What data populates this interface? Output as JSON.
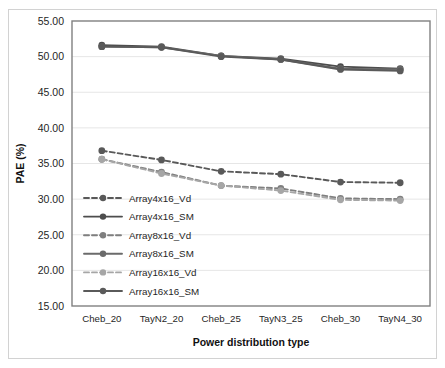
{
  "chart_data": {
    "type": "line",
    "title": "",
    "xlabel": "Power distribution type",
    "ylabel": "PAE (%)",
    "categories": [
      "Cheb_20",
      "TayN2_20",
      "Cheb_25",
      "TayN3_25",
      "Cheb_30",
      "TayN4_30"
    ],
    "ylim": [
      15.0,
      55.0
    ],
    "ytick_step": 5.0,
    "yticks": [
      "15.00",
      "20.00",
      "25.00",
      "30.00",
      "35.00",
      "40.00",
      "45.00",
      "50.00",
      "55.00"
    ],
    "ytick_values": [
      15.0,
      20.0,
      25.0,
      30.0,
      35.0,
      40.0,
      45.0,
      50.0,
      55.0
    ],
    "grid": true,
    "legend_position": "inside-lower-left",
    "series": [
      {
        "name": "Array4x16_Vd",
        "values": [
          36.8,
          35.5,
          33.9,
          33.5,
          32.4,
          32.3
        ],
        "color": "#595959",
        "dash": "5,3",
        "marker": "circle"
      },
      {
        "name": "Array4x16_SM",
        "values": [
          51.6,
          51.4,
          50.1,
          49.7,
          48.6,
          48.3
        ],
        "color": "#4d4d4d",
        "dash": "none",
        "marker": "circle"
      },
      {
        "name": "Array8x16_Vd",
        "values": [
          35.6,
          33.8,
          31.9,
          31.5,
          30.1,
          30.0
        ],
        "color": "#7f7f7f",
        "dash": "5,3",
        "marker": "circle"
      },
      {
        "name": "Array8x16_SM",
        "values": [
          51.4,
          51.3,
          50.1,
          49.6,
          48.3,
          48.2
        ],
        "color": "#6b6b6b",
        "dash": "none",
        "marker": "circle"
      },
      {
        "name": "Array16x16_Vd",
        "values": [
          35.6,
          33.6,
          31.9,
          31.2,
          29.9,
          29.8
        ],
        "color": "#a6a6a6",
        "dash": "5,3",
        "marker": "circle"
      },
      {
        "name": "Array16x16_SM",
        "values": [
          51.4,
          51.3,
          50.0,
          49.6,
          48.2,
          48.0
        ],
        "color": "#5a5a5a",
        "dash": "none",
        "marker": "circle"
      }
    ]
  },
  "layout": {
    "plot_left": 72,
    "plot_top": 21,
    "plot_right": 430,
    "plot_bottom": 306,
    "legend_x": 84,
    "legend_y": 198,
    "legend_row_height": 18.6,
    "legend_sample_width": 38
  }
}
